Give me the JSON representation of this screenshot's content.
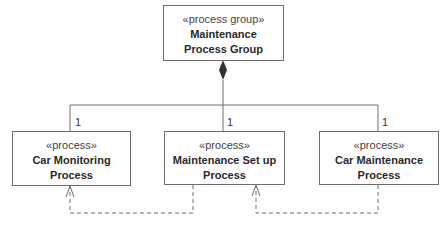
{
  "diagram": {
    "type": "UML process decomposition",
    "group": {
      "stereotype": "«process group»",
      "name": "Maintenance Process Group"
    },
    "processes": [
      {
        "stereotype": "«process»",
        "name": "Car Monitoring Process",
        "multiplicity": "1"
      },
      {
        "stereotype": "«process»",
        "name": "Maintenance Set up Process",
        "multiplicity": "1"
      },
      {
        "stereotype": "«process»",
        "name": "Car Maintenance Process",
        "multiplicity": "1"
      }
    ],
    "relationships": [
      {
        "kind": "composition",
        "from": "Maintenance Process Group",
        "to": [
          "Car Monitoring Process",
          "Maintenance Set up Process",
          "Car Maintenance Process"
        ]
      },
      {
        "kind": "dependency",
        "from": "Maintenance Set up Process",
        "to": "Car Monitoring Process"
      },
      {
        "kind": "dependency",
        "from": "Car Maintenance Process",
        "to": "Maintenance Set up Process"
      }
    ],
    "colors": {
      "line": "#6e6e6e",
      "text": "#2a2a2a",
      "background": "#ffffff"
    }
  }
}
